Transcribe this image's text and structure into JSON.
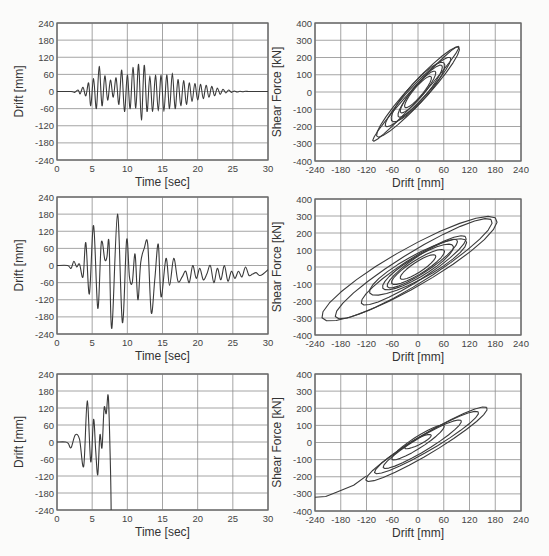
{
  "chart_data": [
    {
      "id": "drift-time-1",
      "type": "line",
      "row": 1,
      "title": "",
      "xlabel": "Time [sec]",
      "ylabel": "Drift [mm]",
      "xlim": [
        0,
        30
      ],
      "ylim": [
        -240,
        240
      ],
      "xticks": [
        0,
        5,
        10,
        15,
        20,
        25,
        30
      ],
      "yticks": [
        240,
        180,
        120,
        60,
        0,
        -60,
        -120,
        -180,
        -240
      ],
      "grid": true,
      "series": [
        {
          "name": "drift",
          "x": [
            0,
            2,
            2.5,
            3,
            3.3,
            3.7,
            4.1,
            4.5,
            4.8,
            5.2,
            5.6,
            6,
            6.4,
            6.8,
            7.2,
            7.6,
            8,
            8.4,
            8.8,
            9.2,
            9.6,
            10,
            10.4,
            10.8,
            11.2,
            11.6,
            12,
            12.4,
            12.8,
            13.2,
            13.6,
            14,
            14.4,
            14.8,
            15.2,
            15.6,
            16,
            16.4,
            16.8,
            17.2,
            17.6,
            18,
            18.4,
            18.8,
            19.2,
            19.6,
            20,
            20.4,
            20.8,
            21.2,
            21.6,
            22,
            22.4,
            22.8,
            23.2,
            23.6,
            24,
            24.4,
            24.8,
            25.2,
            25.6,
            26,
            26.4,
            26.8,
            27.2,
            27.6,
            28,
            28.4,
            28.8,
            29.2,
            29.6,
            30
          ],
          "y": [
            0,
            0,
            -3,
            5,
            -8,
            15,
            -15,
            30,
            -50,
            45,
            -60,
            88,
            -50,
            55,
            -30,
            40,
            -20,
            48,
            -45,
            75,
            -70,
            58,
            -60,
            85,
            -58,
            95,
            -100,
            92,
            -70,
            55,
            -70,
            58,
            -68,
            58,
            -70,
            58,
            -60,
            65,
            -60,
            42,
            -50,
            38,
            -45,
            30,
            -35,
            28,
            -30,
            25,
            -25,
            22,
            -20,
            18,
            -15,
            12,
            -10,
            8,
            -5,
            5,
            -3,
            2,
            -2,
            1,
            -1,
            1,
            0,
            0,
            0,
            0,
            0,
            0,
            0,
            0
          ]
        }
      ]
    },
    {
      "id": "hysteresis-1",
      "type": "line",
      "row": 1,
      "xlabel": "Drift [mm]",
      "ylabel": "Shear Force [kN]",
      "xlim": [
        -240,
        240
      ],
      "ylim": [
        -400,
        400
      ],
      "xticks": [
        -240,
        -180,
        -120,
        -60,
        0,
        60,
        120,
        180,
        240
      ],
      "yticks": [
        400,
        300,
        200,
        100,
        0,
        -100,
        -200,
        -300,
        -400
      ],
      "grid": true,
      "notes": "Narrow hysteresis loops, peaks approx (95, 265) and (-100, -280)"
    },
    {
      "id": "drift-time-2",
      "type": "line",
      "row": 2,
      "xlabel": "Time [sec]",
      "ylabel": "Drift [mm]",
      "xlim": [
        0,
        30
      ],
      "ylim": [
        -240,
        240
      ],
      "xticks": [
        0,
        5,
        10,
        15,
        20,
        25,
        30
      ],
      "yticks": [
        240,
        180,
        120,
        60,
        0,
        -60,
        -120,
        -180,
        -240
      ],
      "grid": true,
      "series": [
        {
          "name": "drift",
          "x": [
            0,
            1.5,
            2,
            2.4,
            2.8,
            3.2,
            3.7,
            4.1,
            4.6,
            5.2,
            5.8,
            6.3,
            6.8,
            7.1,
            7.4,
            7.8,
            8.6,
            9.3,
            9.9,
            10.3,
            10.7,
            11.1,
            11.5,
            11.9,
            12.4,
            12.9,
            13.4,
            13.9,
            14.4,
            14.8,
            15.5,
            16,
            16.6,
            17.2,
            17.8,
            18.3,
            18.8,
            19.3,
            19.8,
            20.3,
            20.8,
            21.3,
            21.8,
            22.3,
            22.8,
            23.3,
            23.8,
            24.3,
            24.8,
            25.3,
            25.8,
            26.3,
            26.8,
            27.3,
            27.8,
            28.3,
            28.8,
            29.3,
            30
          ],
          "y": [
            0,
            0,
            -10,
            15,
            -5,
            5,
            -40,
            80,
            -100,
            140,
            -150,
            80,
            20,
            30,
            80,
            -220,
            180,
            -200,
            90,
            -40,
            -60,
            40,
            -120,
            10,
            60,
            75,
            -165,
            -50,
            75,
            -110,
            25,
            -70,
            25,
            -55,
            -40,
            -20,
            -60,
            0,
            -45,
            -10,
            -50,
            -30,
            0,
            -60,
            -10,
            -50,
            0,
            -55,
            -20,
            -45,
            -20,
            -40,
            -5,
            -35,
            -30,
            -25,
            -35,
            -30,
            -15
          ]
        }
      ]
    },
    {
      "id": "hysteresis-2",
      "type": "line",
      "row": 2,
      "xlabel": "Drift [mm]",
      "ylabel": "Shear Force [kN]",
      "xlim": [
        -240,
        240
      ],
      "ylim": [
        -400,
        400
      ],
      "xticks": [
        -240,
        -180,
        -120,
        -60,
        0,
        60,
        120,
        180,
        240
      ],
      "yticks": [
        400,
        300,
        200,
        100,
        0,
        -100,
        -200,
        -300,
        -400
      ],
      "grid": true,
      "notes": "Wide hysteresis loops, peaks approx (180, 275), (140, 300), (-225, -320), (-190, -270)"
    },
    {
      "id": "drift-time-3",
      "type": "line",
      "row": 3,
      "xlabel": "Time [sec]",
      "ylabel": "Drift [mm]",
      "xlim": [
        0,
        30
      ],
      "ylim": [
        -240,
        240
      ],
      "xticks": [
        0,
        5,
        10,
        15,
        20,
        25,
        30
      ],
      "yticks": [
        240,
        180,
        120,
        60,
        0,
        -60,
        -120,
        -180,
        -240
      ],
      "grid": true,
      "series": [
        {
          "name": "drift",
          "x": [
            0,
            1.2,
            1.6,
            2,
            2.6,
            3.2,
            3.8,
            4.3,
            4.8,
            5.2,
            5.5,
            5.8,
            6.1,
            6.4,
            6.7,
            7.0,
            7.3,
            7.6,
            7.7
          ],
          "y": [
            0,
            0,
            -5,
            -20,
            25,
            10,
            -85,
            145,
            -70,
            80,
            -30,
            -115,
            25,
            -20,
            120,
            100,
            160,
            -90,
            -240
          ]
        }
      ]
    },
    {
      "id": "hysteresis-3",
      "type": "line",
      "row": 3,
      "xlabel": "Drift [mm]",
      "ylabel": "Shear Force [kN]",
      "xlim": [
        -240,
        240
      ],
      "ylim": [
        -400,
        400
      ],
      "xticks": [
        -240,
        -180,
        -120,
        -60,
        0,
        60,
        120,
        180,
        240
      ],
      "yticks": [
        400,
        300,
        200,
        100,
        0,
        -100,
        -200,
        -300,
        -400
      ],
      "grid": true,
      "notes": "Loops up to (160, 215); softening branch to (-240, -320)"
    }
  ]
}
